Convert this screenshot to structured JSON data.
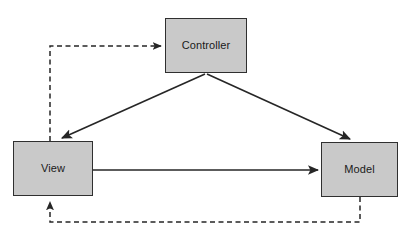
{
  "diagram": {
    "width": 413,
    "height": 233,
    "background_color": "#ffffff",
    "node_fill_color": "#c9c9c9",
    "node_border_color": "#2f2f2f",
    "edge_color": "#262626",
    "label_color": "#1a1a1a",
    "nodes": [
      {
        "id": "controller",
        "label": "Controller",
        "x": 165,
        "y": 18,
        "width": 82,
        "height": 55
      },
      {
        "id": "view",
        "label": "View",
        "x": 13,
        "y": 141,
        "width": 80,
        "height": 55
      },
      {
        "id": "model",
        "label": "Model",
        "x": 321,
        "y": 142,
        "width": 77,
        "height": 55
      }
    ],
    "edges": [
      {
        "id": "controller-to-view",
        "from": "controller",
        "to": "view",
        "style": "solid",
        "arrow": "end"
      },
      {
        "id": "controller-to-model",
        "from": "controller",
        "to": "model",
        "style": "solid",
        "arrow": "end"
      },
      {
        "id": "view-to-model",
        "from": "view",
        "to": "model",
        "style": "solid",
        "arrow": "end"
      },
      {
        "id": "view-to-controller",
        "from": "view",
        "to": "controller",
        "style": "dashed",
        "arrow": "end"
      },
      {
        "id": "model-to-view",
        "from": "model",
        "to": "view",
        "style": "dashed",
        "arrow": "end"
      }
    ]
  }
}
